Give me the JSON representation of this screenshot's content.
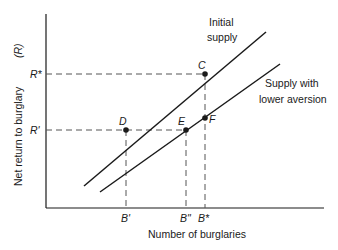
{
  "diagram": {
    "y_axis_label": "Net return to burglary",
    "y_axis_symbol": "(R)",
    "x_axis_label": "Number of burglaries",
    "y_ticks": [
      {
        "label": "R*",
        "y": 74
      },
      {
        "label": "R'",
        "y": 130
      }
    ],
    "x_ticks": [
      {
        "label": "B'",
        "x": 126
      },
      {
        "label": "B\"",
        "x": 186
      },
      {
        "label": "B*",
        "x": 205
      }
    ],
    "curves": [
      {
        "name": "initial-supply",
        "label_line1": "Initial",
        "label_line2": "supply"
      },
      {
        "name": "lower-aversion-supply",
        "label_line1": "Supply with",
        "label_line2": "lower aversion"
      }
    ],
    "points": [
      {
        "label": "C",
        "x": 205,
        "y": 74
      },
      {
        "label": "D",
        "x": 126,
        "y": 130
      },
      {
        "label": "E",
        "x": 186,
        "y": 130
      },
      {
        "label": "F",
        "x": 205,
        "y": 118
      }
    ],
    "colors": {
      "line": "#1a1a1a",
      "dash": "#555555",
      "background": "#ffffff"
    }
  }
}
